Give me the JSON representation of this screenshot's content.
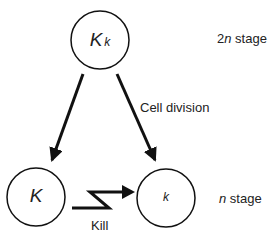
{
  "diagram": {
    "nodes": {
      "diploid": {
        "label_major": "K",
        "label_minor": "k"
      },
      "haploid_left": {
        "label": "K"
      },
      "haploid_right": {
        "label": "k"
      }
    },
    "edges": {
      "cell_division": {
        "label": "Cell division"
      },
      "kill": {
        "label": "Kill"
      }
    },
    "stages": {
      "top": {
        "prefix": "2",
        "italic": "n",
        "suffix": " stage"
      },
      "bottom": {
        "italic": "n",
        "suffix": " stage"
      }
    },
    "colors": {
      "stroke": "#111111",
      "text": "#222222",
      "background": "#ffffff"
    }
  }
}
